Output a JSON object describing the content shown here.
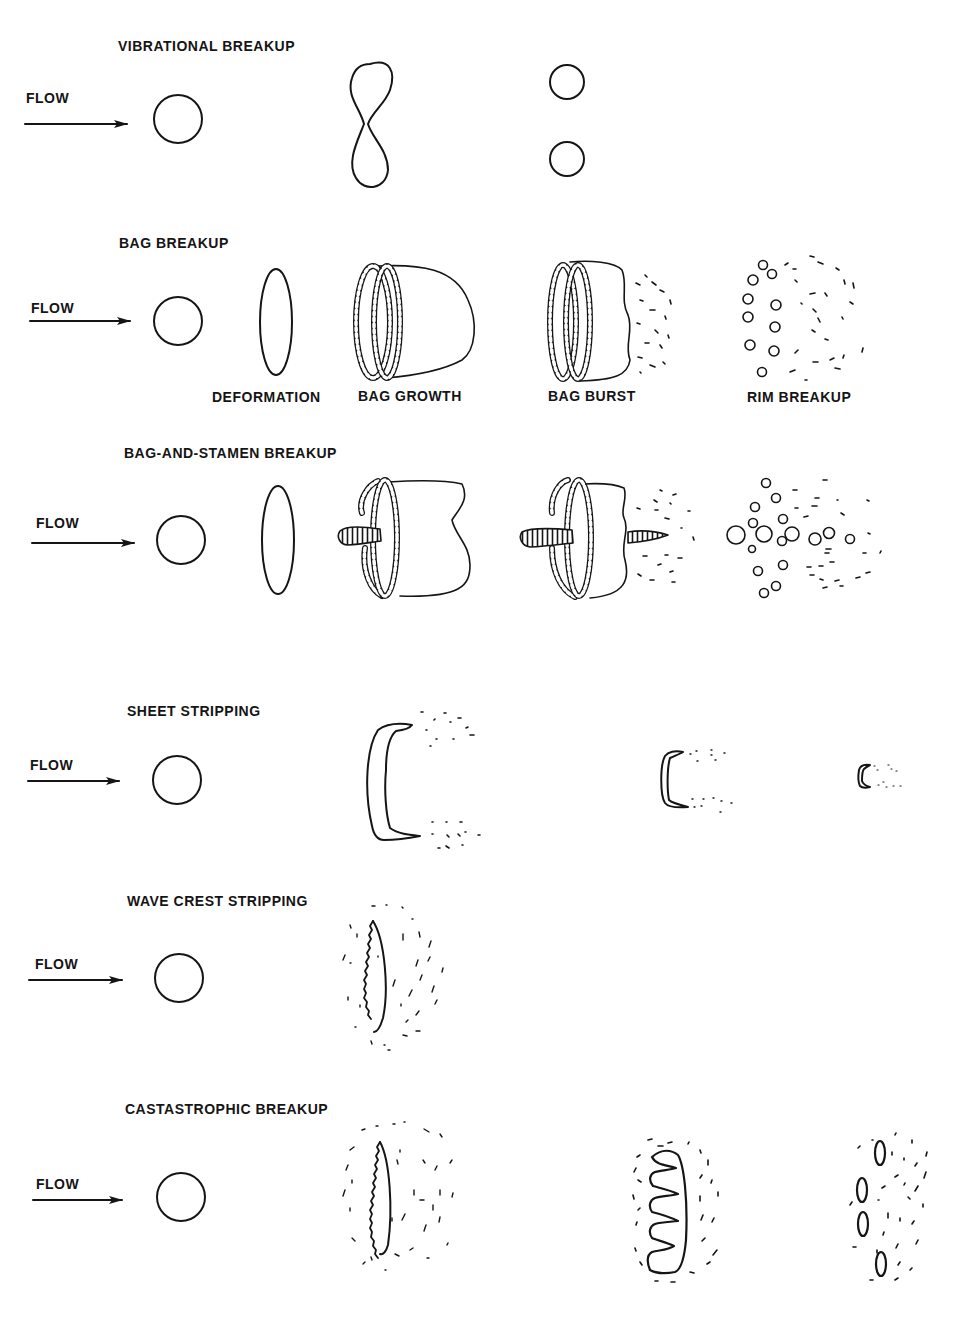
{
  "figure": {
    "flow_label": "FLOW",
    "rows": [
      {
        "id": "vibrational",
        "title": "VIBRATIONAL BREAKUP",
        "stages": [],
        "frames": [
          "sphere-droplet",
          "dumbbell-deformed-droplet",
          "two-daughter-droplets"
        ]
      },
      {
        "id": "bag",
        "title": "BAG BREAKUP",
        "stages": [
          "DEFORMATION",
          "BAG GROWTH",
          "BAG BURST",
          "RIM BREAKUP"
        ],
        "frames": [
          "sphere-droplet",
          "flattened-disk",
          "bag-with-rim",
          "bursting-bag",
          "rim-fragments"
        ]
      },
      {
        "id": "bag-and-stamen",
        "title": "BAG-AND-STAMEN BREAKUP",
        "stages": [],
        "frames": [
          "sphere-droplet",
          "flattened-disk",
          "bag-with-stamen",
          "bursting-bag-with-stamen",
          "fragments"
        ]
      },
      {
        "id": "sheet-stripping",
        "title": "SHEET STRIPPING",
        "stages": [],
        "frames": [
          "sphere-droplet",
          "stripping-sheet-large",
          "stripping-sheet-medium",
          "stripping-sheet-small"
        ]
      },
      {
        "id": "wave-crest-stripping",
        "title": "WAVE CREST STRIPPING",
        "stages": [],
        "frames": [
          "sphere-droplet",
          "wavy-disk-with-mist"
        ]
      },
      {
        "id": "catastrophic",
        "title": "CASTASTROPHIC BREAKUP",
        "stages": [],
        "frames": [
          "sphere-droplet",
          "wavy-disk-with-mist",
          "fingered-disk-with-mist",
          "ligament-fragments-with-mist"
        ]
      }
    ]
  }
}
